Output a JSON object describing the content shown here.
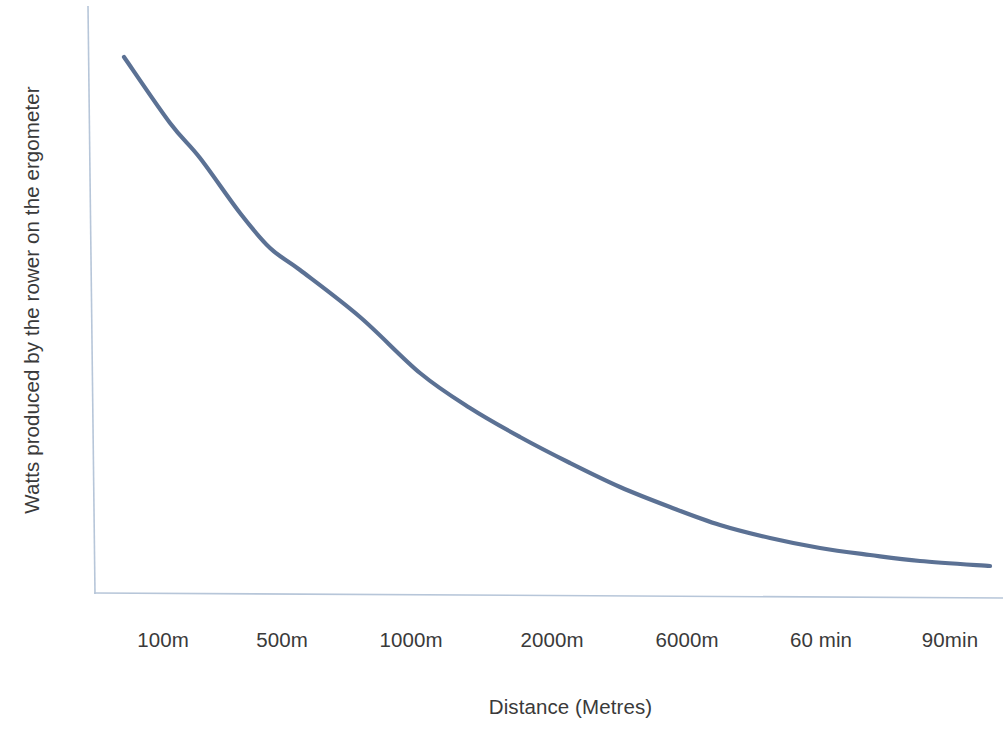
{
  "chart_data": {
    "type": "line",
    "title": "",
    "xlabel": "Distance (Metres)",
    "ylabel": "Watts produced by the rower on the ergometer",
    "categories": [
      "100m",
      "500m",
      "1000m",
      "2000m",
      "6000m",
      "60 min",
      "90min"
    ],
    "series": [
      {
        "name": "Watts produced",
        "values": [
          100,
          73,
          55,
          37,
          22,
          13,
          9
        ]
      }
    ],
    "points": [
      {
        "x": 124,
        "y": 57
      },
      {
        "x": 170,
        "y": 123
      },
      {
        "x": 200,
        "y": 158
      },
      {
        "x": 240,
        "y": 213
      },
      {
        "x": 270,
        "y": 248
      },
      {
        "x": 300,
        "y": 270
      },
      {
        "x": 360,
        "y": 317
      },
      {
        "x": 420,
        "y": 373
      },
      {
        "x": 470,
        "y": 408
      },
      {
        "x": 520,
        "y": 437
      },
      {
        "x": 570,
        "y": 463
      },
      {
        "x": 620,
        "y": 487
      },
      {
        "x": 670,
        "y": 507
      },
      {
        "x": 720,
        "y": 525
      },
      {
        "x": 770,
        "y": 538
      },
      {
        "x": 820,
        "y": 548
      },
      {
        "x": 870,
        "y": 555
      },
      {
        "x": 920,
        "y": 561
      },
      {
        "x": 990,
        "y": 566
      }
    ],
    "grid": false,
    "legend": "none",
    "y_ticks": [],
    "axis_color": "#b7c6d9",
    "series_color": "#5b7194",
    "text_color": "#3a3a3a",
    "background": "#ffffff"
  },
  "axes": {
    "x_title": "Distance (Metres)",
    "y_title": "Watts produced by the rower on the ergometer",
    "x_tick_labels": [
      {
        "label": "100m",
        "pos": 163
      },
      {
        "label": "500m",
        "pos": 282
      },
      {
        "label": "1000m",
        "pos": 411
      },
      {
        "label": "2000m",
        "pos": 552
      },
      {
        "label": "6000m",
        "pos": 687
      },
      {
        "label": "60 min",
        "pos": 821
      },
      {
        "label": "90min",
        "pos": 950
      }
    ]
  }
}
